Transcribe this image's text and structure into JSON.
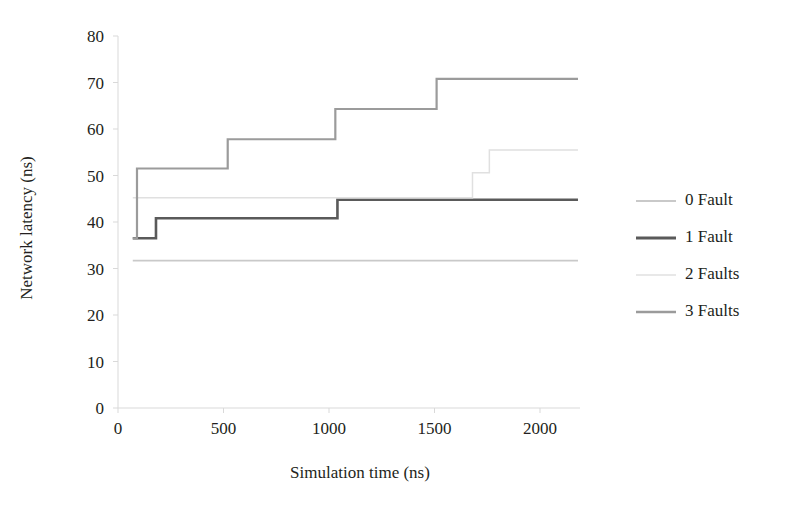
{
  "chart_data": {
    "type": "line",
    "title": "",
    "xlabel": "Simulation time (ns)",
    "ylabel": "Network latency (ns)",
    "xlim": [
      0,
      2180
    ],
    "ylim": [
      0,
      80
    ],
    "xticks": [
      0,
      500,
      1000,
      1500,
      2000
    ],
    "yticks": [
      0,
      10,
      20,
      30,
      40,
      50,
      60,
      70,
      80
    ],
    "xtick_labels": [
      "0",
      "500",
      "1000",
      "1500",
      "2000"
    ],
    "ytick_labels": [
      "0",
      "10",
      "20",
      "30",
      "40",
      "50",
      "60",
      "70",
      "80"
    ],
    "grid": false,
    "legend_position": "right",
    "step_style": "post",
    "series": [
      {
        "name": "0 Fault",
        "color": "#c9c9c9",
        "width": 1.6,
        "x": [
          70,
          2180
        ],
        "y": [
          31.7,
          31.7
        ]
      },
      {
        "name": "1 Fault",
        "color": "#5a5a5a",
        "width": 2.6,
        "x": [
          70,
          180,
          180,
          1040,
          1040,
          1690,
          1690,
          2180
        ],
        "y": [
          36.5,
          36.5,
          40.8,
          40.8,
          44.8,
          44.8,
          44.8,
          44.8
        ]
      },
      {
        "name": "2 Faults",
        "color": "#e0e0e0",
        "width": 1.5,
        "x": [
          70,
          1680,
          1680,
          1760,
          1760,
          2180
        ],
        "y": [
          45.2,
          45.2,
          50.6,
          50.6,
          55.5,
          55.5
        ]
      },
      {
        "name": "3 Faults",
        "color": "#9b9b9b",
        "width": 2.2,
        "x": [
          70,
          90,
          90,
          520,
          520,
          1030,
          1030,
          1510,
          1510,
          2180
        ],
        "y": [
          36.5,
          36.5,
          51.5,
          51.5,
          57.8,
          57.8,
          64.3,
          64.3,
          70.8,
          70.8
        ]
      }
    ],
    "legend": [
      {
        "label": "0 Fault",
        "color": "#c9c9c9",
        "width": 1.8
      },
      {
        "label": "1 Fault",
        "color": "#5a5a5a",
        "width": 3.0
      },
      {
        "label": "2 Faults",
        "color": "#e0e0e0",
        "width": 1.6
      },
      {
        "label": "3 Faults",
        "color": "#9b9b9b",
        "width": 2.4
      }
    ],
    "axis_color": "#d9d9d9"
  }
}
